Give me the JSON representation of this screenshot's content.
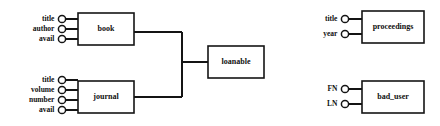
{
  "diagram": {
    "type": "entity-relationship-schema",
    "background_color": "#ffffff",
    "line_color": "#141414",
    "entities": [
      {
        "id": "book",
        "label": "book",
        "box": {
          "x": 78,
          "y": 13,
          "w": 56,
          "h": 32
        },
        "attributes": [
          {
            "label": "title",
            "cx": 62,
            "cy": 19
          },
          {
            "label": "author",
            "cx": 62,
            "cy": 29
          },
          {
            "label": "avail",
            "cx": 62,
            "cy": 39
          }
        ]
      },
      {
        "id": "journal",
        "label": "journal",
        "box": {
          "x": 78,
          "y": 81,
          "w": 56,
          "h": 32
        },
        "attributes": [
          {
            "label": "title",
            "cx": 62,
            "cy": 80
          },
          {
            "label": "volume",
            "cx": 62,
            "cy": 90
          },
          {
            "label": "number",
            "cx": 62,
            "cy": 100
          },
          {
            "label": "avail",
            "cx": 62,
            "cy": 110
          }
        ]
      },
      {
        "id": "loanable",
        "label": "loanable",
        "box": {
          "x": 208,
          "y": 46,
          "w": 56,
          "h": 32
        },
        "attributes": []
      },
      {
        "id": "proceedings",
        "label": "proceedings",
        "box": {
          "x": 362,
          "y": 11,
          "w": 62,
          "h": 32
        },
        "attributes": [
          {
            "label": "title",
            "cx": 345,
            "cy": 19
          },
          {
            "label": "year",
            "cx": 345,
            "cy": 34
          }
        ]
      },
      {
        "id": "bad_user",
        "label": "bad_user",
        "box": {
          "x": 362,
          "y": 81,
          "w": 62,
          "h": 32
        },
        "attributes": [
          {
            "label": "FN",
            "cx": 345,
            "cy": 89
          },
          {
            "label": "LN",
            "cx": 345,
            "cy": 104
          }
        ]
      }
    ],
    "connectors": [
      {
        "name": "book-to-join",
        "points": "134,32 182,32"
      },
      {
        "name": "journal-to-join",
        "points": "134,97 182,97"
      },
      {
        "name": "join-vertical",
        "points": "182,32 182,97"
      },
      {
        "name": "join-to-loanable",
        "points": "182,62 208,62"
      }
    ]
  }
}
